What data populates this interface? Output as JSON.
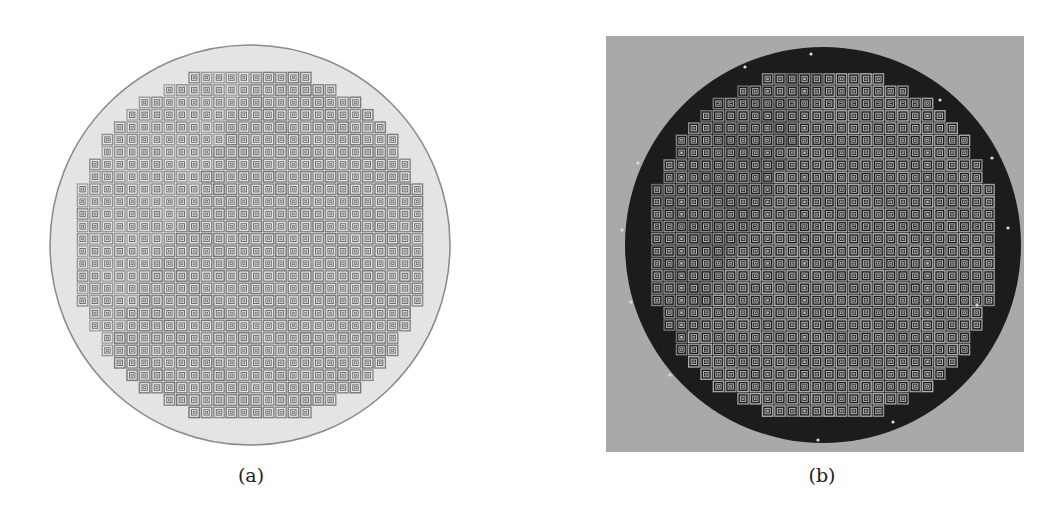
{
  "figure": {
    "panels": [
      {
        "id": "a",
        "caption": "(a)",
        "description": "Layout diagram of circular wafer with grid of square concentric-ring patterns",
        "colors": {
          "background": "#ffffff",
          "disc": "#e4e4e4",
          "disc_edge": "#8a8a8a",
          "square": "#6e6e6e"
        }
      },
      {
        "id": "b",
        "caption": "(b)",
        "description": "Photograph of fabricated wafer with grid of square patterns on dark substrate",
        "colors": {
          "background": "#a9a9a9",
          "disc": "#1c1c1c",
          "square": "#b4b4b4"
        }
      }
    ]
  }
}
